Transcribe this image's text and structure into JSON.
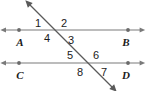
{
  "figure": {
    "kind": "geometry-diagram",
    "width": 146,
    "height": 91,
    "background_color": "#ffffff",
    "line_color": "#7a7a7a",
    "transversal_color": "#5a5a5a",
    "text_color": "#1a1a1a"
  },
  "lines": {
    "top_line": {
      "name": "line-AB",
      "left_endpoint_label": "A",
      "right_endpoint_label": "B",
      "y": 30,
      "x_start": 6,
      "x_end": 140,
      "dot_left_x": 19,
      "dot_right_x": 128,
      "arrows": "both"
    },
    "bottom_line": {
      "name": "line-CD",
      "left_endpoint_label": "C",
      "right_endpoint_label": "D",
      "y": 63,
      "x_start": 6,
      "x_end": 140,
      "dot_left_x": 19,
      "dot_right_x": 128,
      "arrows": "both"
    },
    "transversal": {
      "name": "transversal",
      "x_start": 30,
      "y_start": 5,
      "x_end": 112,
      "y_end": 87,
      "arrows": "both"
    }
  },
  "intersections": [
    {
      "name": "upper-intersection",
      "x": 58,
      "y": 30,
      "on_line": "line-AB"
    },
    {
      "name": "lower-intersection",
      "x": 90,
      "y": 63,
      "on_line": "line-CD"
    }
  ],
  "angle_labels": [
    {
      "id": "1",
      "text": "1",
      "x": 38,
      "y": 18,
      "position": "upper-left"
    },
    {
      "id": "2",
      "text": "2",
      "x": 64,
      "y": 18,
      "position": "upper-right"
    },
    {
      "id": "4",
      "text": "4",
      "x": 47,
      "y": 33,
      "position": "lower-left"
    },
    {
      "id": "3",
      "text": "3",
      "x": 71,
      "y": 35,
      "position": "lower-right"
    },
    {
      "id": "5",
      "text": "5",
      "x": 70,
      "y": 50,
      "position": "upper-left"
    },
    {
      "id": "6",
      "text": "6",
      "x": 96,
      "y": 50,
      "position": "upper-right"
    },
    {
      "id": "8",
      "text": "8",
      "x": 80,
      "y": 67,
      "position": "lower-left"
    },
    {
      "id": "7",
      "text": "7",
      "x": 104,
      "y": 67,
      "position": "lower-right"
    }
  ],
  "point_labels": [
    {
      "id": "A",
      "text": "A",
      "x": 20,
      "y": 37
    },
    {
      "id": "B",
      "text": "B",
      "x": 126,
      "y": 37
    },
    {
      "id": "C",
      "text": "C",
      "x": 20,
      "y": 70
    },
    {
      "id": "D",
      "text": "D",
      "x": 126,
      "y": 70
    }
  ]
}
